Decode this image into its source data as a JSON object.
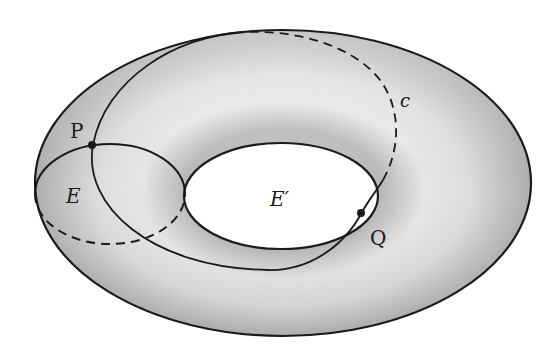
{
  "figure": {
    "type": "torus-diagram"
  },
  "labels": {
    "point_p": "P",
    "point_q": "Q",
    "meridian_e": "E",
    "hole_e_prime": "E′",
    "curve_c": "c"
  },
  "colors": {
    "stroke": "#1a1a1a",
    "surface_light": "#e8e8e8",
    "surface_dark": "#a9a9a9",
    "hole_fill": "#ffffff",
    "background": "#ffffff"
  }
}
